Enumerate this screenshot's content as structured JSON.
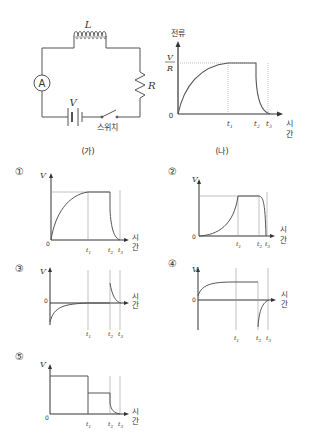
{
  "figure_a": {
    "caption": "(가)",
    "inductor_label": "L",
    "resistor_label": "R",
    "battery_label": "V",
    "ammeter_label": "A",
    "switch_label": "스위치"
  },
  "figure_b": {
    "caption": "(나)",
    "y_axis_label": "전류",
    "y_tick_numerator": "V",
    "y_tick_denominator": "R",
    "origin_label": "0",
    "x_axis_label_1": "시",
    "x_axis_label_2": "간",
    "t1": "t",
    "t2": "t",
    "t3": "t",
    "sub1": "1",
    "sub2": "2",
    "sub3": "3"
  },
  "options": [
    {
      "number": "①",
      "y_label": "V",
      "origin": "0",
      "x1": "시",
      "x2": "간"
    },
    {
      "number": "②",
      "y_label": "V",
      "origin": "0",
      "x1": "시",
      "x2": "간"
    },
    {
      "number": "③",
      "y_label": "V",
      "origin": "0",
      "x1": "시",
      "x2": "간"
    },
    {
      "number": "④",
      "y_label": "V",
      "origin": "0",
      "x1": "시",
      "x2": "간"
    },
    {
      "number": "⑤",
      "y_label": "V",
      "origin": "0",
      "x1": "시",
      "x2": "간"
    }
  ],
  "tick": {
    "t": "t",
    "s1": "1",
    "s2": "2",
    "s3": "3"
  },
  "colors": {
    "line": "#333333",
    "dotted": "#999999",
    "curve": "#555555"
  }
}
